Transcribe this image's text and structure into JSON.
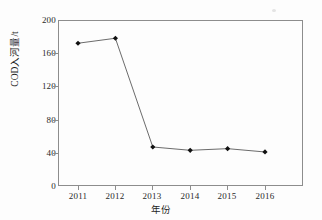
{
  "chart_data": {
    "type": "line",
    "title": "",
    "xlabel": "年份",
    "ylabel": "COD入河量/t",
    "categories": [
      "2011",
      "2012",
      "2013",
      "2014",
      "2015",
      "2016"
    ],
    "values": [
      172,
      178,
      47,
      43,
      45,
      41
    ],
    "series": [
      {
        "name": "COD入河量",
        "values": [
          172,
          178,
          47,
          43,
          45,
          41
        ]
      }
    ],
    "ylim": [
      0,
      200
    ],
    "yticks": [
      0,
      40,
      80,
      120,
      160,
      200
    ],
    "ytick_labels": [
      "0",
      "40",
      "80",
      "120",
      "160",
      "200"
    ],
    "xtick_labels": [
      "2011",
      "2012",
      "2013",
      "2014",
      "2015",
      "2016"
    ],
    "grid": false,
    "legend": false,
    "legend_position": "none",
    "marker": "diamond",
    "line_color": "#555555",
    "marker_color": "#111111"
  },
  "axes": {
    "y_label": "COD入河量/t",
    "x_label": "年份",
    "y_ticks": [
      "0",
      "40",
      "80",
      "120",
      "160",
      "200"
    ],
    "x_ticks": [
      "2011",
      "2012",
      "2013",
      "2014",
      "2015",
      "2016"
    ]
  }
}
